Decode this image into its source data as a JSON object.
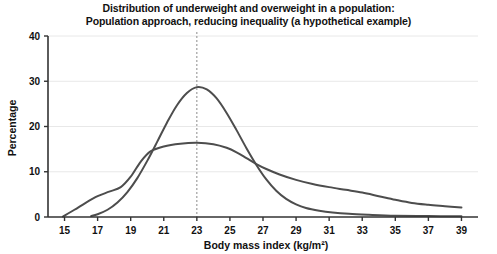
{
  "chart_data": {
    "type": "line",
    "title": "Distribution of underweight and overweight in a population:\nPopulation approach, reducing inequality (a hypothetical example)",
    "title_line1": "Distribution of underweight and overweight in a population:",
    "title_line2": "Population approach, reducing inequality (a hypothetical example)",
    "xlabel": "Body mass index (kg/m²)",
    "ylabel": "Percentage",
    "xlim": [
      14,
      40
    ],
    "ylim": [
      0,
      40
    ],
    "xticks": [
      15,
      17,
      19,
      21,
      23,
      25,
      27,
      29,
      31,
      33,
      35,
      37,
      39
    ],
    "xtick_labels": [
      "15",
      "17",
      "19",
      "21",
      "23",
      "25",
      "27",
      "29",
      "31",
      "33",
      "35",
      "37",
      "39"
    ],
    "yticks": [
      0,
      10,
      20,
      30,
      40
    ],
    "ytick_labels": [
      "0",
      "10",
      "20",
      "30",
      "40"
    ],
    "grid": "horizontal",
    "grid_color": "#e8e8e8",
    "legend": "none",
    "annotations": [
      {
        "name": "reference-line",
        "type": "vline",
        "x": 23,
        "style": "dashed",
        "color": "#8c8c8c"
      }
    ],
    "series": [
      {
        "name": "Population approach (narrowed distribution)",
        "color": "#4d4d4d",
        "width": 2,
        "x": [
          16.6,
          17,
          17.6,
          18.2,
          18.8,
          19.4,
          20,
          20.6,
          21.2,
          21.8,
          22.4,
          23,
          23.6,
          24.2,
          24.8,
          25.4,
          26,
          26.6,
          27.2,
          27.8,
          28.4,
          29,
          29.6,
          30.4,
          31.2,
          32.2,
          33.4,
          35,
          37,
          39
        ],
        "y": [
          0.2,
          0.6,
          1.6,
          3.2,
          5.5,
          8.6,
          12.4,
          16.6,
          20.9,
          24.7,
          27.4,
          28.7,
          28.2,
          26.2,
          23.0,
          19.2,
          15.2,
          11.5,
          8.3,
          5.8,
          4.0,
          2.8,
          2.0,
          1.4,
          1.0,
          0.7,
          0.5,
          0.3,
          0.2,
          0.15
        ]
      },
      {
        "name": "Original distribution (wider, with overweight tail)",
        "color": "#4d4d4d",
        "width": 2,
        "x": [
          14.9,
          15.6,
          16.3,
          17,
          17.7,
          18.4,
          19,
          19.6,
          20.2,
          21,
          22,
          23,
          24,
          24.8,
          25.4,
          26,
          26.6,
          27.2,
          28,
          29,
          30,
          31,
          32,
          33,
          34,
          35,
          36,
          37,
          38,
          39
        ],
        "y": [
          0.1,
          1.6,
          3.2,
          4.6,
          5.6,
          6.6,
          8.9,
          12.2,
          14.5,
          15.6,
          16.2,
          16.4,
          16.1,
          15.3,
          14.3,
          13.0,
          11.7,
          10.6,
          9.4,
          8.2,
          7.3,
          6.6,
          6.0,
          5.4,
          4.6,
          3.8,
          3.1,
          2.7,
          2.4,
          2.1
        ]
      }
    ]
  }
}
